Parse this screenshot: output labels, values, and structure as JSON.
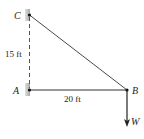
{
  "diagram": {
    "points": {
      "C": {
        "label": "C"
      },
      "A": {
        "label": "A"
      },
      "B": {
        "label": "B"
      }
    },
    "load": {
      "label": "W"
    },
    "dimensions": {
      "vertical": "15 ft",
      "horizontal": "20 ft"
    },
    "colors": {
      "line": "#333333",
      "support": "#b8b8b8",
      "dashed": "#555555"
    }
  }
}
